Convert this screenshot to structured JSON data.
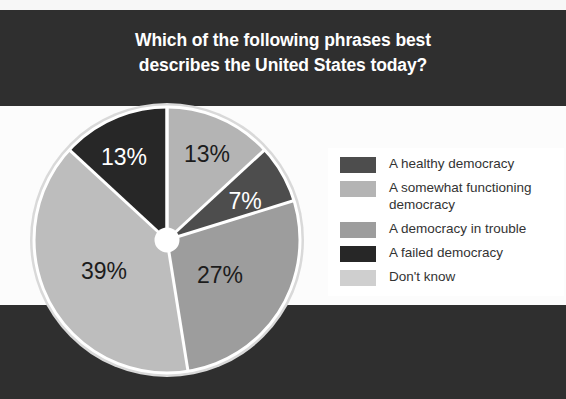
{
  "title": {
    "line1": "Which of the following phrases best",
    "line2": "describes the United States today?"
  },
  "colors": {
    "band_dark": "#2f2f2f",
    "band_light": "#fcfcfc",
    "title_text": "#ffffff",
    "legend_text": "#333333",
    "divider": "#ffffff",
    "hub": "#ffffff",
    "halo": "#d9d9d9"
  },
  "legend": {
    "items": [
      {
        "label": "A healthy democracy",
        "color": "#4d4d4d"
      },
      {
        "label": "A somewhat functioning democracy",
        "color": "#b4b4b4"
      },
      {
        "label": "A democracy in trouble",
        "color": "#9d9d9d"
      },
      {
        "label": "A failed democracy",
        "color": "#272727"
      },
      {
        "label": "Don't know",
        "color": "#cfcfcf"
      }
    ]
  },
  "chart_data": {
    "type": "pie",
    "title": "Which of the following phrases best describes the United States today?",
    "xlabel": "",
    "ylabel": "",
    "legend_position": "right",
    "grid": false,
    "units": "percent",
    "start_angle_deg": 0,
    "direction": "clockwise",
    "labels": [
      "A healthy democracy",
      "A somewhat functioning democracy",
      "A democracy in trouble",
      "Don't know",
      "A failed democracy"
    ],
    "values": [
      13,
      7,
      27,
      39,
      13
    ],
    "display_labels": [
      "13%",
      "7%",
      "27%",
      "39%",
      "13%"
    ],
    "slice_colors": [
      "#b4b4b4",
      "#4d4d4d",
      "#9d9d9d",
      "#bdbdbd",
      "#272727"
    ],
    "label_text_colors": [
      "#1c1c1c",
      "#ffffff",
      "#1c1c1c",
      "#1c1c1c",
      "#ffffff"
    ],
    "label_positions": [
      {
        "x": 179,
        "y": 55
      },
      {
        "x": 217,
        "y": 102
      },
      {
        "x": 192,
        "y": 176
      },
      {
        "x": 76,
        "y": 172
      },
      {
        "x": 96,
        "y": 58
      }
    ]
  }
}
